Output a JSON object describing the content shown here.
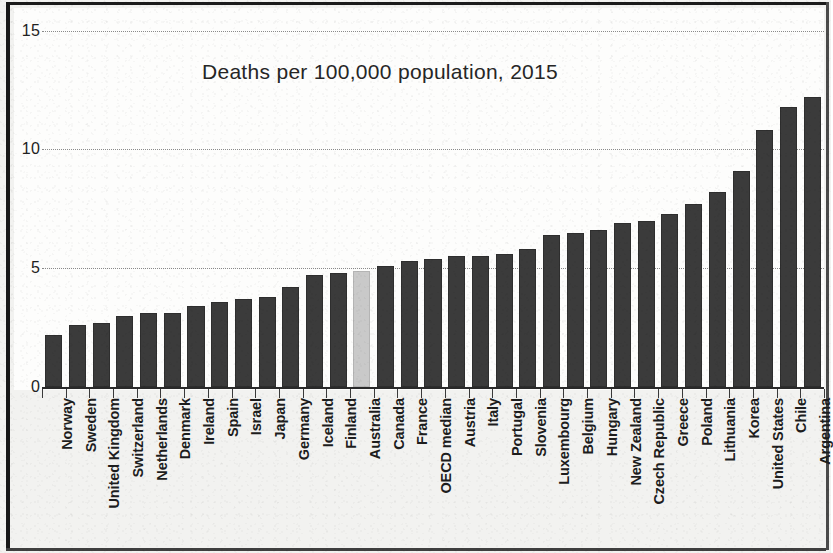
{
  "chart_data": {
    "type": "bar",
    "title": "Deaths per 100,000 population, 2015",
    "xlabel": "",
    "ylabel": "",
    "ylim": [
      0,
      15
    ],
    "yticks": [
      "0",
      "5",
      "10",
      "15"
    ],
    "ytick_values": [
      0,
      5,
      10,
      15
    ],
    "grid": true,
    "legend": null,
    "highlight_category": "Australia",
    "colors": {
      "bar": "#3b3b3b",
      "highlight_bar": "#c9c9c9",
      "gridline": "#8a8a8a",
      "axis": "#2a2a2a",
      "text": "#1d1d1d",
      "background": "#fdfdfc",
      "page": "#f2f2f0",
      "frame": "#171717"
    },
    "categories": [
      "Norway",
      "Sweden",
      "United Kingdom",
      "Switzerland",
      "Netherlands",
      "Denmark",
      "Ireland",
      "Spain",
      "Israel",
      "Japan",
      "Germany",
      "Iceland",
      "Finland",
      "Australia",
      "Canada",
      "France",
      "OECD median",
      "Austria",
      "Italy",
      "Portugal",
      "Slovenia",
      "Luxembourg",
      "Belgium",
      "Hungary",
      "New Zealand",
      "Czech Republic",
      "Greece",
      "Poland",
      "Lithuania",
      "Korea",
      "United States",
      "Chile",
      "Argentina"
    ],
    "values": [
      2.2,
      2.6,
      2.7,
      3.0,
      3.1,
      3.1,
      3.4,
      3.6,
      3.7,
      3.8,
      4.2,
      4.7,
      4.8,
      4.9,
      5.1,
      5.3,
      5.4,
      5.5,
      5.5,
      5.6,
      5.8,
      6.4,
      6.5,
      6.6,
      6.9,
      7.0,
      7.3,
      7.7,
      8.2,
      9.1,
      10.8,
      11.8,
      12.2
    ]
  }
}
